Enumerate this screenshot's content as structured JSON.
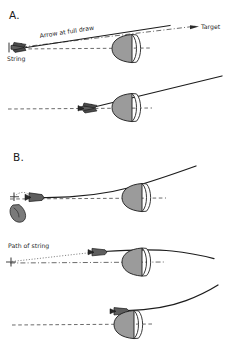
{
  "figure": {
    "background_color": "#ffffff",
    "width": 229,
    "height": 354,
    "line_color": "#1c1c1c",
    "riser_fill_color": "#9b9b9b",
    "axis_color": "#5a5a5a"
  },
  "panels": [
    {
      "id": "panel-a",
      "letter": "A.",
      "frames": [
        {
          "id": "a-frame-1",
          "labels": [
            {
              "name": "arrow-at-full-draw-label",
              "text": "Arrow at full draw"
            },
            {
              "name": "string-label",
              "text": "String"
            },
            {
              "name": "target-label",
              "text": "Target"
            }
          ]
        },
        {
          "id": "a-frame-2",
          "labels": []
        }
      ]
    },
    {
      "id": "panel-b",
      "letter": "B.",
      "frames": [
        {
          "id": "b-frame-1",
          "labels": []
        },
        {
          "id": "b-frame-2",
          "labels": [
            {
              "name": "path-of-string-label",
              "text": "Path of string"
            }
          ]
        },
        {
          "id": "b-frame-3",
          "labels": []
        }
      ]
    }
  ],
  "annotations": {
    "arrow_at_full_draw": "Arrow at full draw",
    "string": "String",
    "target": "Target",
    "path_of_string": "Path of string"
  },
  "panel_letters": {
    "a": "A.",
    "b": "B."
  }
}
